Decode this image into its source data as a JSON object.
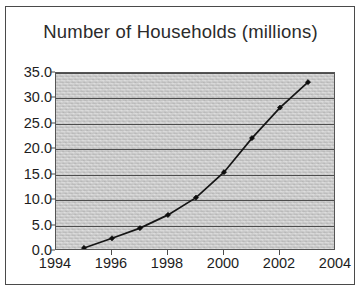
{
  "figure": {
    "title": "Number of Households (millions)"
  },
  "chart_data": {
    "type": "line",
    "title": "Number of Households (millions)",
    "xlabel": "",
    "ylabel": "",
    "x": [
      1995,
      1996,
      1997,
      1998,
      1999,
      2000,
      2001,
      2002,
      2003
    ],
    "values": [
      0.6,
      2.5,
      4.5,
      7.1,
      10.5,
      15.5,
      22.2,
      28.2,
      33.2
    ],
    "series": [
      {
        "name": "Number of Households (millions)",
        "x": [
          1995,
          1996,
          1997,
          1998,
          1999,
          2000,
          2001,
          2002,
          2003
        ],
        "values": [
          0.6,
          2.5,
          4.5,
          7.1,
          10.5,
          15.5,
          22.2,
          28.2,
          33.2
        ]
      }
    ],
    "xlim": [
      1994,
      2004
    ],
    "ylim": [
      0,
      35
    ],
    "xticks": [
      1994,
      1996,
      1998,
      2000,
      2002,
      2004
    ],
    "xtick_labels": [
      "1994",
      "1996",
      "1998",
      "2000",
      "2002",
      "2004"
    ],
    "yticks": [
      0,
      5,
      10,
      15,
      20,
      25,
      30,
      35
    ],
    "ytick_labels": [
      "0.0",
      "5.0",
      "10.0",
      "15.0",
      "20.0",
      "25.0",
      "30.0",
      "35.0"
    ],
    "grid": "horizontal",
    "legend": "none",
    "marker": "filled-diamond",
    "line_color": "#151515",
    "plot_background": "#c9c9c9"
  }
}
